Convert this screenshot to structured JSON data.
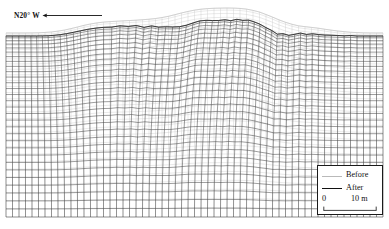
{
  "figure": {
    "type": "finite-element-mesh-deformation-cross-section",
    "background_color": "#ffffff",
    "width": 389,
    "height": 229
  },
  "direction_indicator": {
    "name": "section-direction",
    "label": "N20°  W",
    "arrow_direction": "left",
    "arrow_color": "#111111",
    "line_x_start": 47,
    "line_x_end": 101,
    "line_y": 16
  },
  "legend": {
    "box": {
      "x": 317,
      "y": 165,
      "width": 66,
      "height": 50
    },
    "border_color": "#1a1a1a",
    "entries": [
      {
        "label": "Before",
        "style": "thin-light",
        "color": "#b9b9b9"
      },
      {
        "label": "After",
        "style": "thick-dark",
        "color": "#111111"
      }
    ],
    "scale_bar": {
      "start_label": "0",
      "end_label": "10 m",
      "min": 0,
      "max": 10,
      "units": "m",
      "ticks": 2,
      "color": "#111111"
    }
  },
  "mesh": {
    "before": {
      "color": "#c0c0c0",
      "line_width": 0.35,
      "label": "Before"
    },
    "after": {
      "color": "#2b2b2b",
      "line_width": 0.5,
      "label": "After"
    },
    "domain": {
      "x0": 6,
      "x1": 383,
      "y_top": 33,
      "y_bottom": 217
    },
    "columns": 58,
    "rows": 30,
    "row_grading_power": 1.35,
    "surface_before": [
      [
        0.0,
        33.0
      ],
      [
        0.03,
        33.0
      ],
      [
        0.06,
        33.0
      ],
      [
        0.09,
        32.8
      ],
      [
        0.12,
        32.0
      ],
      [
        0.15,
        30.5
      ],
      [
        0.18,
        28.0
      ],
      [
        0.205,
        25.5
      ],
      [
        0.23,
        23.5
      ],
      [
        0.255,
        22.2
      ],
      [
        0.285,
        21.4
      ],
      [
        0.315,
        20.8
      ],
      [
        0.345,
        20.2
      ],
      [
        0.375,
        19.4
      ],
      [
        0.405,
        18.2
      ],
      [
        0.435,
        16.0
      ],
      [
        0.465,
        13.0
      ],
      [
        0.495,
        10.4
      ],
      [
        0.525,
        8.8
      ],
      [
        0.555,
        8.2
      ],
      [
        0.585,
        8.0
      ],
      [
        0.615,
        8.2
      ],
      [
        0.645,
        9.4
      ],
      [
        0.672,
        12.0
      ],
      [
        0.7,
        16.0
      ],
      [
        0.725,
        20.0
      ],
      [
        0.75,
        23.5
      ],
      [
        0.775,
        25.8
      ],
      [
        0.8,
        27.0
      ],
      [
        0.825,
        28.0
      ],
      [
        0.85,
        29.5
      ],
      [
        0.88,
        31.0
      ],
      [
        0.91,
        32.2
      ],
      [
        0.94,
        32.8
      ],
      [
        0.97,
        33.0
      ],
      [
        1.0,
        33.0
      ]
    ],
    "surface_after": [
      [
        0.0,
        36.0
      ],
      [
        0.03,
        36.0
      ],
      [
        0.06,
        36.0
      ],
      [
        0.09,
        36.0
      ],
      [
        0.12,
        35.8
      ],
      [
        0.15,
        35.0
      ],
      [
        0.18,
        33.2
      ],
      [
        0.205,
        31.0
      ],
      [
        0.23,
        28.8
      ],
      [
        0.255,
        27.4
      ],
      [
        0.285,
        27.0
      ],
      [
        0.3,
        24.8
      ],
      [
        0.315,
        27.2
      ],
      [
        0.33,
        25.2
      ],
      [
        0.345,
        27.4
      ],
      [
        0.36,
        25.6
      ],
      [
        0.375,
        27.6
      ],
      [
        0.39,
        26.0
      ],
      [
        0.405,
        27.8
      ],
      [
        0.42,
        26.4
      ],
      [
        0.435,
        26.8
      ],
      [
        0.45,
        25.0
      ],
      [
        0.465,
        23.0
      ],
      [
        0.48,
        21.2
      ],
      [
        0.495,
        19.8
      ],
      [
        0.51,
        21.4
      ],
      [
        0.525,
        19.6
      ],
      [
        0.54,
        21.0
      ],
      [
        0.555,
        19.4
      ],
      [
        0.57,
        20.8
      ],
      [
        0.585,
        19.2
      ],
      [
        0.6,
        20.6
      ],
      [
        0.615,
        19.6
      ],
      [
        0.63,
        21.0
      ],
      [
        0.645,
        22.8
      ],
      [
        0.66,
        25.0
      ],
      [
        0.672,
        27.5
      ],
      [
        0.69,
        30.5
      ],
      [
        0.7,
        33.0
      ],
      [
        0.712,
        35.0
      ],
      [
        0.725,
        33.6
      ],
      [
        0.74,
        35.6
      ],
      [
        0.752,
        33.2
      ],
      [
        0.765,
        35.4
      ],
      [
        0.778,
        32.6
      ],
      [
        0.79,
        34.8
      ],
      [
        0.805,
        33.0
      ],
      [
        0.82,
        35.2
      ],
      [
        0.835,
        34.0
      ],
      [
        0.85,
        35.6
      ],
      [
        0.87,
        35.0
      ],
      [
        0.89,
        36.0
      ],
      [
        0.91,
        35.4
      ],
      [
        0.93,
        36.0
      ],
      [
        0.955,
        36.0
      ],
      [
        0.98,
        36.0
      ],
      [
        1.0,
        36.0
      ]
    ],
    "deformation_field": {
      "description": "horizontal shear lobe, maximum near mid-section, decaying with depth",
      "center_u": 0.46,
      "half_width_u": 0.4,
      "max_shift_px": 11.5,
      "depth_decay": 1.9,
      "secondary_center_u": 0.2,
      "secondary_shift_px": -6.0,
      "secondary_half_width_u": 0.17
    }
  }
}
